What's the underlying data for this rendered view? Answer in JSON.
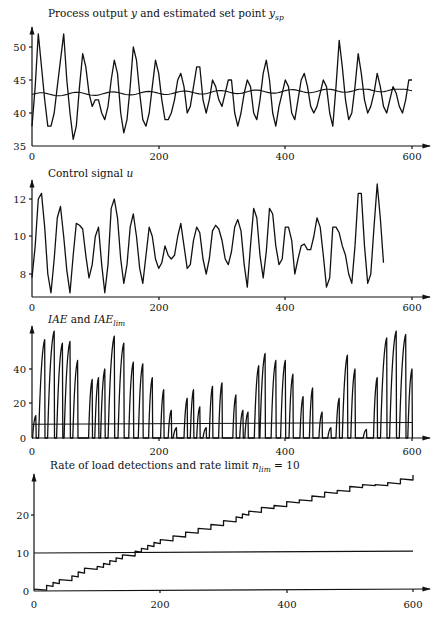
{
  "chart_data": [
    {
      "type": "line",
      "title": "Process output y and estimated set point y_sp",
      "xlabel": "",
      "ylabel": "",
      "xlim": [
        0,
        600
      ],
      "ylim": [
        35,
        52
      ],
      "xticks": [
        "0",
        "200",
        "400",
        "600"
      ],
      "yticks": [
        "35",
        "40",
        "45",
        "50"
      ],
      "series": [
        {
          "name": "y",
          "x": [
            0,
            5,
            10,
            15,
            20,
            25,
            30,
            35,
            40,
            45,
            50,
            55,
            60,
            65,
            70,
            75,
            80,
            85,
            90,
            95,
            100,
            105,
            110,
            115,
            120,
            125,
            130,
            135,
            140,
            145,
            150,
            155,
            160,
            165,
            170,
            175,
            180,
            185,
            190,
            195,
            200,
            205,
            210,
            215,
            220,
            225,
            230,
            235,
            240,
            245,
            250,
            255,
            260,
            265,
            270,
            275,
            280,
            285,
            290,
            295,
            300,
            305,
            310,
            315,
            320,
            325,
            330,
            335,
            340,
            345,
            350,
            355,
            360,
            365,
            370,
            375,
            380,
            385,
            390,
            395,
            400,
            405,
            410,
            415,
            420,
            425,
            430,
            435,
            440,
            445,
            450,
            455,
            460,
            465,
            470,
            475,
            480,
            485,
            490,
            495,
            500,
            505,
            510,
            515,
            520,
            525,
            530,
            535,
            540,
            545,
            550,
            555,
            560,
            565,
            570,
            575,
            580,
            585,
            590,
            595,
            600
          ],
          "values": [
            38,
            44,
            52,
            47,
            42,
            38,
            38,
            40,
            44,
            48,
            52,
            45,
            40,
            36,
            38,
            44,
            49,
            47,
            43,
            41,
            42,
            42,
            40,
            39,
            41,
            45,
            48,
            46,
            40,
            37,
            39,
            44,
            50,
            48,
            43,
            39,
            38,
            40,
            44,
            48,
            46,
            42,
            39,
            39,
            40,
            42,
            45,
            46,
            44,
            40,
            41,
            44,
            47,
            47,
            42,
            40,
            42,
            45,
            44,
            42,
            41,
            43,
            45,
            45,
            40,
            38,
            40,
            43,
            45,
            44,
            40,
            39,
            42,
            46,
            48,
            45,
            40,
            38,
            41,
            43,
            45,
            44,
            40,
            39,
            42,
            45,
            46,
            44,
            41,
            40,
            41,
            43,
            45,
            44,
            40,
            38,
            44,
            51,
            47,
            42,
            39,
            40,
            44,
            49,
            46,
            42,
            40,
            41,
            43,
            46,
            44,
            41,
            40,
            42,
            44,
            43,
            41,
            40,
            42,
            45,
            45
          ]
        },
        {
          "name": "y_sp",
          "x": [
            0,
            100,
            200,
            300,
            400,
            500,
            600
          ],
          "values": [
            42.8,
            43.0,
            43.1,
            43.2,
            43.3,
            43.4,
            43.3
          ]
        }
      ]
    },
    {
      "type": "line",
      "title": "Control signal u",
      "xlim": [
        0,
        600
      ],
      "ylim": [
        7,
        13
      ],
      "xticks": [
        "0",
        "200",
        "400",
        "600"
      ],
      "yticks": [
        "8",
        "10",
        "12"
      ],
      "series": [
        {
          "name": "u",
          "x": [
            0,
            5,
            10,
            15,
            20,
            25,
            30,
            35,
            40,
            45,
            50,
            55,
            60,
            65,
            70,
            75,
            80,
            85,
            90,
            95,
            100,
            105,
            110,
            115,
            120,
            125,
            130,
            135,
            140,
            145,
            150,
            155,
            160,
            165,
            170,
            175,
            180,
            185,
            190,
            195,
            200,
            205,
            210,
            215,
            220,
            225,
            230,
            235,
            240,
            245,
            250,
            255,
            260,
            265,
            270,
            275,
            280,
            285,
            290,
            295,
            300,
            305,
            310,
            315,
            320,
            325,
            330,
            335,
            340,
            345,
            350,
            355,
            360,
            365,
            370,
            375,
            380,
            385,
            390,
            395,
            400,
            405,
            410,
            415,
            420,
            425,
            430,
            435,
            440,
            445,
            450,
            455,
            460,
            465,
            470,
            475,
            480,
            485,
            490,
            495,
            500,
            505,
            510,
            515,
            520,
            525,
            530,
            535,
            540,
            545,
            550,
            555,
            560,
            565,
            570,
            575,
            580,
            585,
            590,
            595,
            600
          ],
          "values": [
            7.8,
            9.5,
            12.0,
            12.3,
            10.5,
            8.0,
            7.0,
            8.8,
            11.0,
            11.6,
            10.0,
            8.2,
            7.0,
            9.0,
            10.7,
            10.6,
            10.4,
            9.0,
            7.8,
            8.5,
            10.0,
            10.5,
            8.5,
            7.0,
            8.5,
            11.5,
            12.0,
            11.0,
            8.8,
            7.5,
            8.5,
            10.5,
            11.2,
            10.0,
            8.3,
            7.5,
            9.0,
            10.5,
            10.0,
            8.8,
            8.3,
            8.6,
            9.5,
            9.0,
            8.8,
            9.0,
            10.0,
            10.7,
            9.5,
            8.3,
            8.5,
            9.8,
            10.5,
            10.2,
            8.8,
            8.0,
            8.8,
            10.3,
            10.6,
            10.4,
            9.8,
            8.8,
            8.5,
            9.2,
            10.5,
            10.9,
            10.3,
            8.5,
            7.3,
            9.5,
            11.5,
            11.0,
            9.0,
            7.8,
            9.2,
            11.5,
            11.2,
            9.5,
            8.5,
            8.8,
            10.5,
            10.5,
            9.8,
            8.0,
            8.8,
            9.5,
            9.6,
            9.3,
            9.3,
            10.0,
            11.0,
            10.5,
            9.0,
            7.3,
            7.8,
            10.5,
            10.5,
            10.2,
            9.5,
            9.0,
            8.0,
            7.5,
            9.5,
            12.3,
            12.3,
            9.5,
            7.5,
            8.0,
            10.5,
            12.8,
            11.0,
            8.6
          ]
        }
      ]
    },
    {
      "type": "line",
      "title": "IAE and IAE_lim",
      "xlim": [
        0,
        600
      ],
      "ylim": [
        0,
        62
      ],
      "xticks": [
        "0",
        "200",
        "400",
        "600"
      ],
      "yticks": [
        "0",
        "20",
        "40"
      ],
      "series": [
        {
          "name": "IAE",
          "peaks": [
            {
              "x": 6,
              "y": 13
            },
            {
              "x": 20,
              "y": 57
            },
            {
              "x": 35,
              "y": 62
            },
            {
              "x": 48,
              "y": 55
            },
            {
              "x": 60,
              "y": 56
            },
            {
              "x": 72,
              "y": 45
            },
            {
              "x": 95,
              "y": 34
            },
            {
              "x": 105,
              "y": 35
            },
            {
              "x": 115,
              "y": 40
            },
            {
              "x": 130,
              "y": 59
            },
            {
              "x": 145,
              "y": 55
            },
            {
              "x": 160,
              "y": 44
            },
            {
              "x": 175,
              "y": 43
            },
            {
              "x": 190,
              "y": 35
            },
            {
              "x": 208,
              "y": 28
            },
            {
              "x": 220,
              "y": 16
            },
            {
              "x": 228,
              "y": 6
            },
            {
              "x": 245,
              "y": 23
            },
            {
              "x": 255,
              "y": 28
            },
            {
              "x": 265,
              "y": 18
            },
            {
              "x": 275,
              "y": 6
            },
            {
              "x": 285,
              "y": 30
            },
            {
              "x": 300,
              "y": 32
            },
            {
              "x": 322,
              "y": 25
            },
            {
              "x": 333,
              "y": 16
            },
            {
              "x": 341,
              "y": 15
            },
            {
              "x": 358,
              "y": 42
            },
            {
              "x": 368,
              "y": 49
            },
            {
              "x": 385,
              "y": 45
            },
            {
              "x": 400,
              "y": 45
            },
            {
              "x": 412,
              "y": 37
            },
            {
              "x": 428,
              "y": 24
            },
            {
              "x": 443,
              "y": 29
            },
            {
              "x": 458,
              "y": 15
            },
            {
              "x": 472,
              "y": 6
            },
            {
              "x": 485,
              "y": 23
            },
            {
              "x": 498,
              "y": 48
            },
            {
              "x": 510,
              "y": 40
            },
            {
              "x": 528,
              "y": 5
            },
            {
              "x": 545,
              "y": 35
            },
            {
              "x": 560,
              "y": 58
            },
            {
              "x": 575,
              "y": 62
            },
            {
              "x": 590,
              "y": 60
            },
            {
              "x": 600,
              "y": 40
            }
          ]
        },
        {
          "name": "IAE_lim",
          "x": [
            0,
            600
          ],
          "values": [
            8,
            9
          ]
        }
      ]
    },
    {
      "type": "line",
      "title": "Rate of load detections and rate limit n_lim = 10",
      "xlim": [
        0,
        600
      ],
      "ylim": [
        0,
        30
      ],
      "xticks": [
        "0",
        "200",
        "400",
        "600"
      ],
      "yticks": [
        "0",
        "10",
        "20"
      ],
      "series": [
        {
          "name": "rate of load detections",
          "x": [
            0,
            20,
            40,
            60,
            80,
            100,
            120,
            140,
            160,
            180,
            200,
            220,
            240,
            260,
            280,
            300,
            320,
            340,
            360,
            380,
            400,
            420,
            440,
            460,
            480,
            500,
            520,
            540,
            560,
            580,
            600
          ],
          "values": [
            0.5,
            1.5,
            3,
            4,
            6,
            6.5,
            8,
            9.5,
            10.5,
            12,
            13.5,
            14.5,
            15.5,
            16.5,
            17.5,
            18.5,
            19.5,
            21,
            22,
            22.5,
            23.5,
            24,
            25,
            26,
            26.5,
            27.5,
            28,
            28,
            28.5,
            29.5,
            30.5
          ]
        },
        {
          "name": "n_lim",
          "x": [
            0,
            600
          ],
          "values": [
            10,
            11
          ]
        }
      ]
    }
  ],
  "panels": [
    {
      "title_main": "Process output ",
      "title_var1": "y",
      "title_mid": " and estimated set point ",
      "title_var2": "y",
      "title_sub2": "sp",
      "yticks": [
        "50",
        "45",
        "40",
        "35"
      ],
      "xticks": [
        "0",
        "200",
        "400",
        "600"
      ]
    },
    {
      "title_main": "Control signal ",
      "title_var1": "u",
      "yticks": [
        "12",
        "10",
        "8"
      ],
      "xticks": [
        "0",
        "200",
        "400",
        "600"
      ]
    },
    {
      "title_var1": "IAE",
      "title_mid": " and ",
      "title_var2": "IAE",
      "title_sub2": "lim",
      "yticks": [
        "40",
        "20",
        "0"
      ],
      "xticks": [
        "0",
        "200",
        "400",
        "600"
      ]
    },
    {
      "title_main": "Rate of load detections and rate limit ",
      "title_var2": "n",
      "title_sub2": "lim",
      "title_tail": " = 10",
      "yticks": [
        "20",
        "10",
        "0"
      ],
      "xticks": [
        "0",
        "200",
        "400",
        "600"
      ]
    }
  ]
}
